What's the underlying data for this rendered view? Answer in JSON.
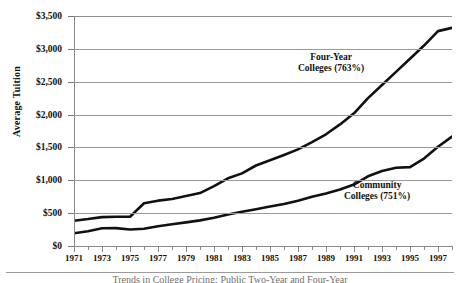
{
  "figure": {
    "ylabel": "Average Tuition",
    "caption": "Trends in College Pricing: Public Two-Year and Four-Year"
  },
  "annotations": {
    "four_year": {
      "line1": "Four-Year",
      "line2": "Colleges (763%)"
    },
    "community": {
      "line1": "Community",
      "line2": "Colleges (751%)"
    }
  },
  "chart_data": {
    "type": "line",
    "title": "",
    "xlabel": "",
    "ylabel": "Average Tuition",
    "ylim": [
      0,
      3500
    ],
    "ytick_labels": [
      "$0",
      "$500",
      "$1,000",
      "$1,500",
      "$2,000",
      "$2,500",
      "$3,000",
      "$3,500"
    ],
    "ytick_values": [
      0,
      500,
      1000,
      1500,
      2000,
      2500,
      3000,
      3500
    ],
    "grid": "horizontal",
    "legend": "inline-annotations",
    "x": [
      1971,
      1972,
      1973,
      1974,
      1975,
      1976,
      1977,
      1978,
      1979,
      1980,
      1981,
      1982,
      1983,
      1984,
      1985,
      1986,
      1987,
      1988,
      1989,
      1990,
      1991,
      1992,
      1993,
      1994,
      1995,
      1996,
      1997,
      1998
    ],
    "xtick_labels": [
      "1971",
      "1973",
      "1975",
      "1977",
      "1979",
      "1981",
      "1983",
      "1985",
      "1987",
      "1989",
      "1991",
      "1993",
      "1995",
      "1997"
    ],
    "series": [
      {
        "name": "Four-Year Colleges (763%)",
        "growth_label": "763%",
        "values": [
          385,
          410,
          440,
          445,
          445,
          650,
          690,
          715,
          760,
          805,
          910,
          1030,
          1105,
          1225,
          1305,
          1385,
          1470,
          1580,
          1700,
          1850,
          2020,
          2250,
          2450,
          2650,
          2850,
          3050,
          3270,
          3320
        ]
      },
      {
        "name": "Community Colleges (751%)",
        "growth_label": "751%",
        "values": [
          195,
          225,
          270,
          272,
          250,
          262,
          300,
          330,
          360,
          390,
          430,
          480,
          520,
          560,
          600,
          640,
          690,
          750,
          800,
          860,
          935,
          1060,
          1140,
          1190,
          1200,
          1330,
          1510,
          1665
        ]
      }
    ]
  }
}
